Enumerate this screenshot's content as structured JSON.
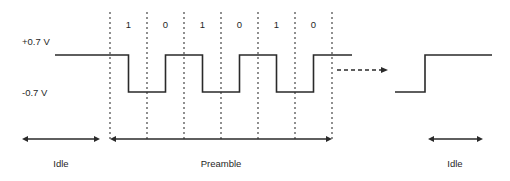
{
  "diagram": {
    "type": "signal-timing-diagram",
    "width": 510,
    "height": 181,
    "background_color": "#ffffff",
    "signal_color": "#2a2a2a",
    "gridline_color": "#555555",
    "text_color": "#1f1f1f"
  },
  "voltage_axis": {
    "high_label": "+0.7 V",
    "low_label": "-0.7 V",
    "high_y": 55,
    "low_y": 92
  },
  "bits": [
    {
      "label": "1",
      "index": 0,
      "cell_x": 110,
      "cell_width": 37
    },
    {
      "label": "0",
      "index": 1,
      "cell_x": 147,
      "cell_width": 37
    },
    {
      "label": "1",
      "index": 2,
      "cell_x": 184,
      "cell_width": 37
    },
    {
      "label": "0",
      "index": 3,
      "cell_x": 221,
      "cell_width": 37
    },
    {
      "label": "1",
      "index": 4,
      "cell_x": 258,
      "cell_width": 37
    },
    {
      "label": "0",
      "index": 5,
      "cell_x": 295,
      "cell_width": 37
    }
  ],
  "gridlines": {
    "x_positions": [
      110,
      147,
      184,
      221,
      258,
      295,
      332
    ],
    "y_top": 12,
    "y_bottom": 140,
    "dash_pattern": "2,3"
  },
  "waveform": {
    "idle_start_x": 55,
    "idle_end_x": 110,
    "preamble_end_x": 332,
    "tail_end_x": 352
  },
  "continuation_arrow": {
    "name": "dashed-continuation-arrow",
    "x_start": 337,
    "x_end": 388,
    "y": 70,
    "dash_pattern": "4,3"
  },
  "trailing_step": {
    "name": "rising-edge-step",
    "low_start_x": 395,
    "rise_x": 425,
    "high_end_x": 492,
    "low_y": 92,
    "high_y": 55
  },
  "regions": [
    {
      "label": "Idle",
      "name": "idle-left",
      "arrow_x_start": 22,
      "arrow_x_end": 100,
      "arrow_y": 139,
      "label_x": 61,
      "label_y": 167
    },
    {
      "label": "Preamble",
      "name": "preamble",
      "arrow_x_start": 110,
      "arrow_x_end": 332,
      "arrow_y": 139,
      "label_x": 221,
      "label_y": 167
    },
    {
      "label": "Idle",
      "name": "idle-right",
      "arrow_x_start": 428,
      "arrow_x_end": 483,
      "arrow_y": 139,
      "label_x": 455,
      "label_y": 167
    }
  ],
  "labels": {
    "voltage_high_x": 22,
    "voltage_high_y": 45,
    "voltage_low_x": 22,
    "voltage_low_y": 96,
    "bit_label_y": 28
  }
}
